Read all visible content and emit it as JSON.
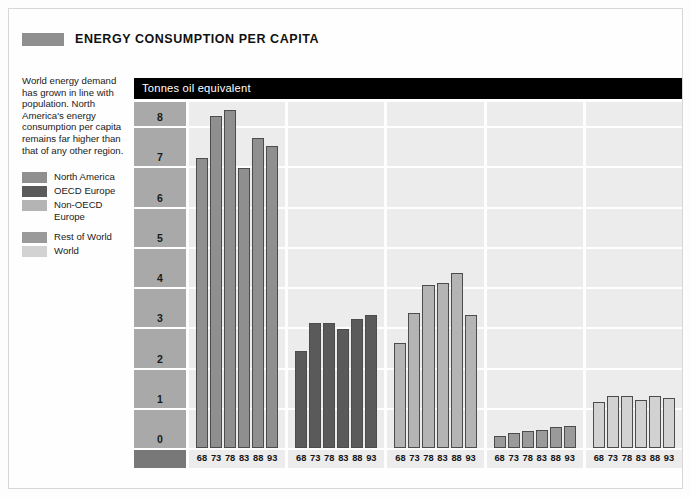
{
  "header": {
    "title": "ENERGY CONSUMPTION PER CAPITA",
    "swatch_color": "#8f8f8f"
  },
  "sidebar": {
    "description": "World energy demand has grown in line with population. North America's energy consumption per capita remains far higher than that of any other region.",
    "legend": [
      {
        "label": "North America",
        "color": "#8f8f8f"
      },
      {
        "label": "OECD Europe",
        "color": "#5a5a5a"
      },
      {
        "label": "Non-OECD Europe",
        "color": "#b4b4b4"
      },
      {
        "label": "Rest of World",
        "color": "#9a9a9a"
      },
      {
        "label": "World",
        "color": "#d2d2d2"
      }
    ]
  },
  "chart_data": {
    "type": "bar",
    "title": "ENERGY CONSUMPTION PER CAPITA",
    "subtitle": "Tonnes oil equivalent",
    "ylabel": "Tonnes oil equivalent",
    "xlabel": "",
    "ylim": [
      0,
      8.6
    ],
    "yticks": [
      0,
      1,
      2,
      3,
      4,
      5,
      6,
      7,
      8
    ],
    "ytick_labels": [
      "0",
      "1",
      "2",
      "3",
      "4",
      "5",
      "6",
      "7",
      "8"
    ],
    "grid": true,
    "legend_position": "left-sidebar",
    "categories": [
      "68",
      "73",
      "78",
      "83",
      "88",
      "93"
    ],
    "series": [
      {
        "name": "North America",
        "color": "#8f8f8f",
        "values": [
          7.2,
          8.25,
          8.4,
          6.95,
          7.7,
          7.5
        ]
      },
      {
        "name": "OECD Europe",
        "color": "#5a5a5a",
        "values": [
          2.4,
          3.1,
          3.1,
          2.95,
          3.2,
          3.3
        ]
      },
      {
        "name": "Non-OECD Europe",
        "color": "#b4b4b4",
        "values": [
          2.6,
          3.35,
          4.05,
          4.1,
          4.35,
          3.3
        ]
      },
      {
        "name": "Rest of World",
        "color": "#9a9a9a",
        "values": [
          0.3,
          0.38,
          0.42,
          0.45,
          0.52,
          0.55
        ]
      },
      {
        "name": "World",
        "color": "#d2d2d2",
        "values": [
          1.15,
          1.3,
          1.3,
          1.2,
          1.3,
          1.25
        ]
      }
    ]
  }
}
